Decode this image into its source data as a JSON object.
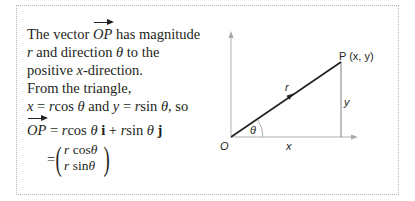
{
  "text": {
    "intro_a": "The vector ",
    "vec_name": "OP",
    "intro_b": " has magnitude",
    "line2_r": "r",
    "line2_a": " and direction ",
    "line2_theta": "θ",
    "line2_b": " to the",
    "line3_a": "positive ",
    "line3_x": "x",
    "line3_b": "-direction.",
    "line4": "From the triangle,",
    "line5_x": "x",
    "line5_a": " = ",
    "line5_r": "r",
    "line5_b": "cos ",
    "line5_theta": "θ",
    "line5_c": " and ",
    "line5_y": "y",
    "line5_d": " = ",
    "line5_r2": "r",
    "line5_e": "sin ",
    "line5_theta2": "θ",
    "line5_f": ", so",
    "eq_vec": "OP",
    "eq_a": " = ",
    "eq_r": "r",
    "eq_b": "cos ",
    "eq_theta": "θ",
    "eq_i": " i",
    "eq_c": " + ",
    "eq_r2": "r",
    "eq_d": "sin ",
    "eq_theta2": "θ",
    "eq_j": " j",
    "mat_eq": "=",
    "mat_top_r": "r",
    "mat_top": " cos",
    "mat_top_theta": "θ",
    "mat_bot_r": "r",
    "mat_bot": " sin",
    "mat_bot_theta": "θ"
  },
  "diagram": {
    "point_label": "P (x, y)",
    "origin_label": "O",
    "hyp_label": "r",
    "angle_label": "θ",
    "x_label": "x",
    "y_label": "y"
  },
  "colors": {
    "text": "#231f20",
    "axes": "#b0b0b0",
    "border": "#b8b8b8"
  }
}
